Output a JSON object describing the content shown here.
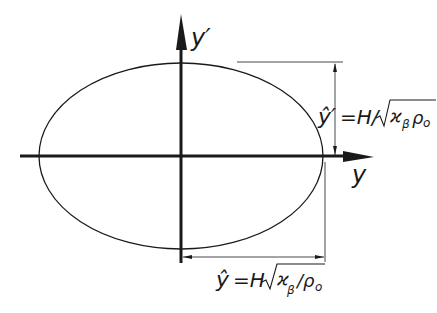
{
  "diagram": {
    "type": "phase-space ellipse",
    "axes": {
      "horizontal_label": "y",
      "vertical_label": "y′"
    },
    "ellipse": {
      "cx": 181,
      "cy": 156,
      "rx": 142,
      "ry": 93
    },
    "dimensions": {
      "vertical": {
        "label_hat": "ŷ′",
        "label_eq": "=H/",
        "label_sqrt_content": "ϰ",
        "label_sub": "β",
        "label_tail": "ρ",
        "label_tail_sub": "o"
      },
      "horizontal": {
        "label_hat": "ŷ",
        "label_eq": "=H",
        "label_sqrt_content": "ϰ",
        "label_sub": "β",
        "label_tail": "/ρ",
        "label_tail_sub": "o"
      }
    },
    "colors": {
      "line": "#1a1a1a",
      "background": "#ffffff"
    }
  }
}
